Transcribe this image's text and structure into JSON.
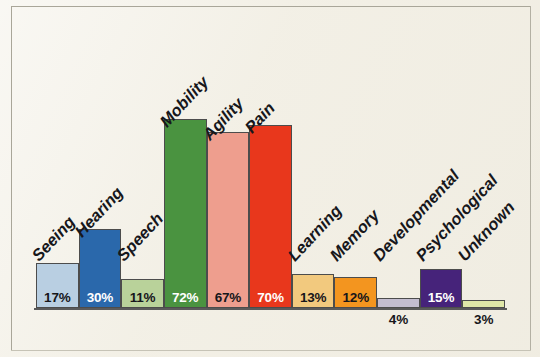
{
  "figure": {
    "background_color": "#f2efe5",
    "border_color": "#a9a699"
  },
  "chart_data": {
    "type": "bar",
    "title": "",
    "subtitle": "",
    "xlabel": "",
    "ylabel": "",
    "ylim": [
      0,
      80
    ],
    "grid": false,
    "legend": "none",
    "value_suffix": "%",
    "categories": [
      "Seeing",
      "Hearing",
      "Speech",
      "Mobility",
      "Agility",
      "Pain",
      "Learning",
      "Memory",
      "Developmental",
      "Psychological",
      "Unknown"
    ],
    "values": [
      17,
      30,
      11,
      72,
      67,
      70,
      13,
      12,
      4,
      15,
      3
    ],
    "value_labels": [
      "17%",
      "30%",
      "11%",
      "72%",
      "67%",
      "70%",
      "13%",
      "12%",
      "4%",
      "15%",
      "3%"
    ],
    "colors": [
      "#b9cfe2",
      "#2a68ab",
      "#b9d29a",
      "#4a9340",
      "#ee9e8e",
      "#e8371c",
      "#f2c97e",
      "#f3951f",
      "#c3bdd0",
      "#46237a",
      "#dfe7a8"
    ],
    "label_on_dark": [
      false,
      true,
      false,
      true,
      false,
      true,
      false,
      false,
      false,
      true,
      false
    ],
    "label_below_bar": [
      false,
      false,
      false,
      false,
      false,
      false,
      false,
      false,
      true,
      false,
      true
    ]
  }
}
